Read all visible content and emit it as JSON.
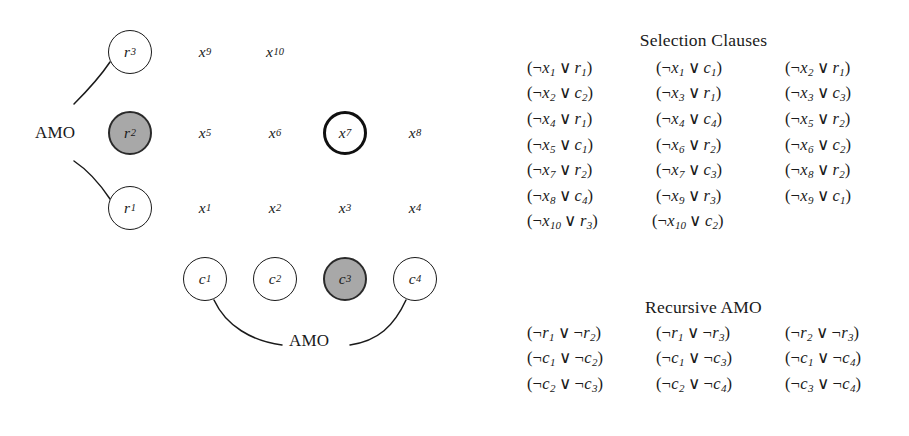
{
  "figure": {
    "caption_absent": true,
    "background_color": "#ffffff",
    "ink_color": "#1a1a1a",
    "filled_node_color": "#a8a8a8"
  },
  "diagram": {
    "amo_label_left": "AMO",
    "amo_label_bottom": "AMO",
    "row_nodes": [
      {
        "id": "r3",
        "base": "r",
        "sub": "3",
        "style": "plain",
        "x": 130,
        "y": 52
      },
      {
        "id": "r2",
        "base": "r",
        "sub": "2",
        "style": "filled",
        "x": 130,
        "y": 133
      },
      {
        "id": "r1",
        "base": "r",
        "sub": "1",
        "style": "plain",
        "x": 130,
        "y": 208
      }
    ],
    "col_nodes": [
      {
        "id": "c1",
        "base": "c",
        "sub": "1",
        "style": "plain",
        "x": 205,
        "y": 279
      },
      {
        "id": "c2",
        "base": "c",
        "sub": "2",
        "style": "plain",
        "x": 275,
        "y": 279
      },
      {
        "id": "c3",
        "base": "c",
        "sub": "3",
        "style": "filled",
        "x": 345,
        "y": 279
      },
      {
        "id": "c4",
        "base": "c",
        "sub": "4",
        "style": "plain",
        "x": 415,
        "y": 279
      }
    ],
    "variables": [
      {
        "id": "x9",
        "base": "x",
        "sub": "9",
        "style": "plain",
        "x": 205,
        "y": 52
      },
      {
        "id": "x10",
        "base": "x",
        "sub": "10",
        "style": "plain",
        "x": 277,
        "y": 52
      },
      {
        "id": "x5",
        "base": "x",
        "sub": "5",
        "style": "plain",
        "x": 205,
        "y": 133
      },
      {
        "id": "x6",
        "base": "x",
        "sub": "6",
        "style": "plain",
        "x": 275,
        "y": 133
      },
      {
        "id": "x7",
        "base": "x",
        "sub": "7",
        "style": "thick",
        "x": 345,
        "y": 133
      },
      {
        "id": "x8",
        "base": "x",
        "sub": "8",
        "style": "plain",
        "x": 415,
        "y": 133
      },
      {
        "id": "x1",
        "base": "x",
        "sub": "1",
        "style": "plain",
        "x": 205,
        "y": 208
      },
      {
        "id": "x2",
        "base": "x",
        "sub": "2",
        "style": "plain",
        "x": 275,
        "y": 208
      },
      {
        "id": "x3",
        "base": "x",
        "sub": "3",
        "style": "plain",
        "x": 345,
        "y": 208
      },
      {
        "id": "x4",
        "base": "x",
        "sub": "4",
        "style": "plain",
        "x": 415,
        "y": 208
      }
    ]
  },
  "selection_clauses": {
    "title": "Selection Clauses",
    "rows": [
      [
        {
          "left": {
            "neg": true,
            "base": "x",
            "sub": "1"
          },
          "right": {
            "neg": false,
            "base": "r",
            "sub": "1"
          }
        },
        {
          "left": {
            "neg": true,
            "base": "x",
            "sub": "1"
          },
          "right": {
            "neg": false,
            "base": "c",
            "sub": "1"
          }
        },
        {
          "left": {
            "neg": true,
            "base": "x",
            "sub": "2"
          },
          "right": {
            "neg": false,
            "base": "r",
            "sub": "1"
          }
        }
      ],
      [
        {
          "left": {
            "neg": true,
            "base": "x",
            "sub": "2"
          },
          "right": {
            "neg": false,
            "base": "c",
            "sub": "2"
          }
        },
        {
          "left": {
            "neg": true,
            "base": "x",
            "sub": "3"
          },
          "right": {
            "neg": false,
            "base": "r",
            "sub": "1"
          }
        },
        {
          "left": {
            "neg": true,
            "base": "x",
            "sub": "3"
          },
          "right": {
            "neg": false,
            "base": "c",
            "sub": "3"
          }
        }
      ],
      [
        {
          "left": {
            "neg": true,
            "base": "x",
            "sub": "4"
          },
          "right": {
            "neg": false,
            "base": "r",
            "sub": "1"
          }
        },
        {
          "left": {
            "neg": true,
            "base": "x",
            "sub": "4"
          },
          "right": {
            "neg": false,
            "base": "c",
            "sub": "4"
          }
        },
        {
          "left": {
            "neg": true,
            "base": "x",
            "sub": "5"
          },
          "right": {
            "neg": false,
            "base": "r",
            "sub": "2"
          }
        }
      ],
      [
        {
          "left": {
            "neg": true,
            "base": "x",
            "sub": "5"
          },
          "right": {
            "neg": false,
            "base": "c",
            "sub": "1"
          }
        },
        {
          "left": {
            "neg": true,
            "base": "x",
            "sub": "6"
          },
          "right": {
            "neg": false,
            "base": "r",
            "sub": "2"
          }
        },
        {
          "left": {
            "neg": true,
            "base": "x",
            "sub": "6"
          },
          "right": {
            "neg": false,
            "base": "c",
            "sub": "2"
          }
        }
      ],
      [
        {
          "left": {
            "neg": true,
            "base": "x",
            "sub": "7"
          },
          "right": {
            "neg": false,
            "base": "r",
            "sub": "2"
          }
        },
        {
          "left": {
            "neg": true,
            "base": "x",
            "sub": "7"
          },
          "right": {
            "neg": false,
            "base": "c",
            "sub": "3"
          }
        },
        {
          "left": {
            "neg": true,
            "base": "x",
            "sub": "8"
          },
          "right": {
            "neg": false,
            "base": "r",
            "sub": "2"
          }
        }
      ],
      [
        {
          "left": {
            "neg": true,
            "base": "x",
            "sub": "8"
          },
          "right": {
            "neg": false,
            "base": "c",
            "sub": "4"
          }
        },
        {
          "left": {
            "neg": true,
            "base": "x",
            "sub": "9"
          },
          "right": {
            "neg": false,
            "base": "r",
            "sub": "3"
          }
        },
        {
          "left": {
            "neg": true,
            "base": "x",
            "sub": "9"
          },
          "right": {
            "neg": false,
            "base": "c",
            "sub": "1"
          }
        }
      ],
      [
        {
          "left": {
            "neg": true,
            "base": "x",
            "sub": "10"
          },
          "right": {
            "neg": false,
            "base": "r",
            "sub": "3"
          }
        },
        {
          "left": {
            "neg": true,
            "base": "x",
            "sub": "10"
          },
          "right": {
            "neg": false,
            "base": "c",
            "sub": "2"
          }
        }
      ]
    ]
  },
  "recursive_amo": {
    "title": "Recursive AMO",
    "rows": [
      [
        {
          "left": {
            "neg": true,
            "base": "r",
            "sub": "1"
          },
          "right": {
            "neg": true,
            "base": "r",
            "sub": "2"
          }
        },
        {
          "left": {
            "neg": true,
            "base": "r",
            "sub": "1"
          },
          "right": {
            "neg": true,
            "base": "r",
            "sub": "3"
          }
        },
        {
          "left": {
            "neg": true,
            "base": "r",
            "sub": "2"
          },
          "right": {
            "neg": true,
            "base": "r",
            "sub": "3"
          }
        }
      ],
      [
        {
          "left": {
            "neg": true,
            "base": "c",
            "sub": "1"
          },
          "right": {
            "neg": true,
            "base": "c",
            "sub": "2"
          }
        },
        {
          "left": {
            "neg": true,
            "base": "c",
            "sub": "1"
          },
          "right": {
            "neg": true,
            "base": "c",
            "sub": "3"
          }
        },
        {
          "left": {
            "neg": true,
            "base": "c",
            "sub": "1"
          },
          "right": {
            "neg": true,
            "base": "c",
            "sub": "4"
          }
        }
      ],
      [
        {
          "left": {
            "neg": true,
            "base": "c",
            "sub": "2"
          },
          "right": {
            "neg": true,
            "base": "c",
            "sub": "3"
          }
        },
        {
          "left": {
            "neg": true,
            "base": "c",
            "sub": "2"
          },
          "right": {
            "neg": true,
            "base": "c",
            "sub": "4"
          }
        },
        {
          "left": {
            "neg": true,
            "base": "c",
            "sub": "3"
          },
          "right": {
            "neg": true,
            "base": "c",
            "sub": "4"
          }
        }
      ]
    ]
  },
  "symbols": {
    "negation": "¬",
    "disjunction": "∨",
    "paren_open": "(",
    "paren_close": ")"
  }
}
